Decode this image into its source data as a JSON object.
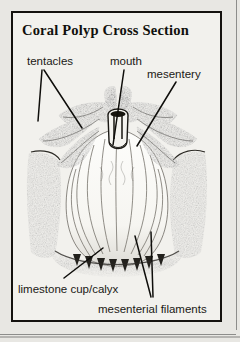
{
  "figure": {
    "title": "Coral Polyp Cross Section",
    "kind": "labeled biological diagram",
    "style": "black-and-white scanned line drawing / stipple engraving on off-white paper",
    "background_color": "#f2f1ed",
    "ink_color": "#14120f",
    "border": "double rule: thick black inner rectangle inside a plain page edge"
  },
  "labels": [
    {
      "id": "tentacles",
      "text": "tentacles",
      "points_to": "the ring of stippled arms radiating outward from the top of the polyp",
      "leader_count": 2
    },
    {
      "id": "mouth",
      "text": "mouth",
      "points_to": "the dark vertical central opening / pharynx at the top centre",
      "leader_count": 1
    },
    {
      "id": "mesentery",
      "text": "mesentery",
      "points_to": "the partition sheet running down into the body from the right of the mouth",
      "leader_count": 1
    },
    {
      "id": "limestone_cup",
      "text": "limestone cup/calyx",
      "points_to": "the dark shaded skeletal cup enclosing the lower body",
      "leader_count": 1
    },
    {
      "id": "mesenterial_filaments",
      "text": "mesenterial filaments",
      "points_to": "the wavy threads at the base of the body cavity",
      "leader_count": 2
    }
  ],
  "anatomy": {
    "tentacles": "eight stippled tapering tentacles spread left and right in a crown",
    "mouth": "dark slot-shaped central opening leading into a tubular pharynx",
    "body": "bulbous sac with vertical wavy internal partitions",
    "cup_walls": "two dark textured columns tapering inward on the left and right",
    "base": "dark jagged fringe where the filaments meet the skeleton"
  }
}
